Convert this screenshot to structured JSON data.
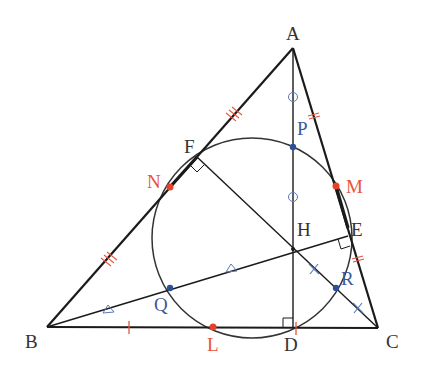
{
  "diagram": {
    "colors": {
      "line": "#1a1a1a",
      "circle": "#333333",
      "red_point": "#e8412a",
      "blue_point": "#2d4f99",
      "red_mark": "#e8543a",
      "blue_mark": "#5a78b5",
      "label_black": "#333333"
    },
    "points": {
      "A": {
        "x": 293,
        "y": 48,
        "label": "A"
      },
      "B": {
        "x": 47,
        "y": 327,
        "label": "B"
      },
      "C": {
        "x": 378,
        "y": 328,
        "label": "C"
      },
      "D": {
        "x": 293,
        "y": 328,
        "label": "D"
      },
      "E": {
        "x": 348,
        "y": 236,
        "label": "E"
      },
      "F": {
        "x": 197,
        "y": 157,
        "label": "F"
      },
      "H": {
        "x": 293,
        "y": 249,
        "label": "H"
      },
      "L": {
        "x": 213,
        "y": 327,
        "label": "L"
      },
      "M": {
        "x": 336,
        "y": 186,
        "label": "M"
      },
      "N": {
        "x": 170,
        "y": 187,
        "label": "N"
      },
      "P": {
        "x": 293,
        "y": 147,
        "label": "P"
      },
      "Q": {
        "x": 170,
        "y": 288,
        "label": "Q"
      },
      "R": {
        "x": 336,
        "y": 288,
        "label": "R"
      }
    },
    "circle": {
      "cx": 252,
      "cy": 238,
      "r": 100
    },
    "labels": {
      "A": "A",
      "B": "B",
      "C": "C",
      "D": "D",
      "E": "E",
      "F": "F",
      "H": "H",
      "L": "L",
      "M": "M",
      "N": "N",
      "P": "P",
      "Q": "Q",
      "R": "R"
    },
    "marks": {
      "AP_PH": "circle",
      "BQ_QH": "triangle",
      "HR_RC": "cross",
      "BL_LC": "single-tick",
      "AM_MC": "double-tick",
      "AN_NB": "triple-tick"
    },
    "right_angles": [
      "D",
      "E",
      "F"
    ]
  }
}
